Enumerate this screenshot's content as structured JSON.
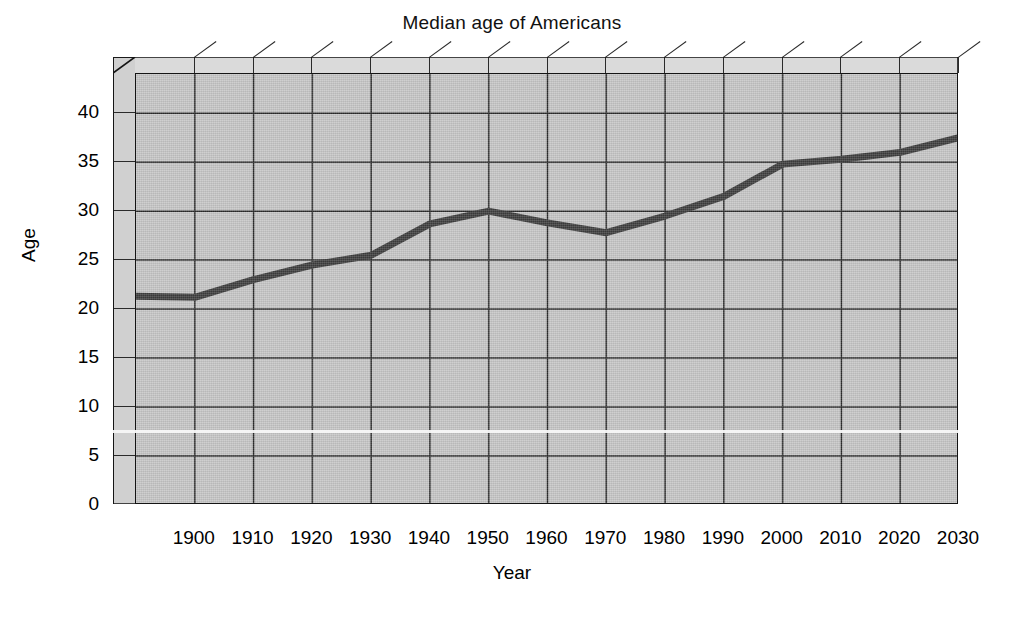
{
  "chart_data": {
    "type": "line",
    "title": "Median age of Americans",
    "xlabel": "Year",
    "ylabel": "Age",
    "x": [
      1890,
      1900,
      1910,
      1920,
      1930,
      1940,
      1950,
      1960,
      1970,
      1980,
      1990,
      2000,
      2010,
      2020,
      2030
    ],
    "values": [
      21.3,
      21.2,
      23.0,
      24.5,
      25.5,
      28.7,
      30.0,
      28.8,
      27.8,
      29.5,
      31.5,
      34.8,
      35.3,
      36.0,
      37.5
    ],
    "series": [
      {
        "name": "Median age",
        "values": [
          21.3,
          21.2,
          23.0,
          24.5,
          25.5,
          28.7,
          30.0,
          28.8,
          27.8,
          29.5,
          31.5,
          34.8,
          35.3,
          36.0,
          37.5
        ]
      }
    ],
    "xlim": [
      1890,
      2030
    ],
    "ylim": [
      0,
      44
    ],
    "xticks": [
      1900,
      1910,
      1920,
      1930,
      1940,
      1950,
      1960,
      1970,
      1980,
      1990,
      2000,
      2010,
      2020,
      2030
    ],
    "yticks": [
      0,
      5,
      10,
      15,
      20,
      25,
      30,
      35,
      40
    ],
    "xtick_labels": [
      "1900",
      "1910",
      "1920",
      "1930",
      "1940",
      "1950",
      "1960",
      "1970",
      "1980",
      "1990",
      "2000",
      "2010",
      "2020",
      "2030"
    ],
    "ytick_labels": [
      "0",
      "5",
      "10",
      "15",
      "20",
      "25",
      "30",
      "35",
      "40"
    ],
    "grid": true,
    "legend": false,
    "legend_position": "none",
    "style": "3d-box",
    "colors": {
      "line": "#3d3d3d",
      "plot_background": "#c6c6c6",
      "wall": "#d4d4d4",
      "axis": "#141414",
      "grid": "#2b2b2b",
      "page_background": "#ffffff",
      "text": "#111111"
    },
    "line_width_px": 7,
    "annotations": []
  }
}
